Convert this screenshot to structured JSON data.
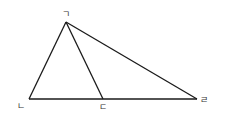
{
  "diagram": {
    "type": "triangle-with-cevian",
    "points": {
      "A": {
        "label": "ㄱ"
      },
      "B": {
        "label": "ㄴ"
      },
      "C": {
        "label": "ㄷ"
      },
      "D": {
        "label": "ㄹ"
      }
    },
    "segments": [
      {
        "from": "A",
        "to": "B"
      },
      {
        "from": "A",
        "to": "C"
      },
      {
        "from": "A",
        "to": "D"
      },
      {
        "from": "B",
        "to": "D"
      }
    ],
    "line_color": "#1a1a1a"
  }
}
